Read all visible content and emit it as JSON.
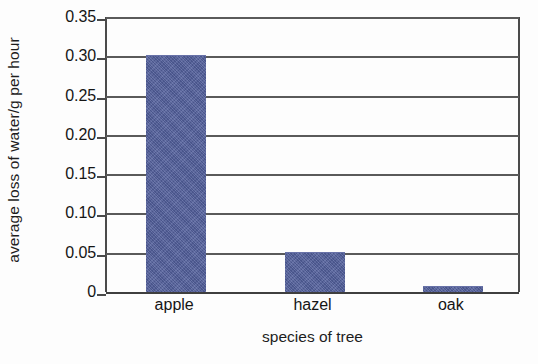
{
  "chart_data": {
    "type": "bar",
    "title": "",
    "xlabel": "species of tree",
    "ylabel": "average loss of water/g per hour",
    "categories": [
      "apple",
      "hazel",
      "oak"
    ],
    "values": [
      0.3,
      0.05,
      0.007
    ],
    "ylim": [
      0,
      0.35
    ],
    "ytick_labels": [
      "0",
      "0.05",
      "0.10",
      "0.15",
      "0.20",
      "0.25",
      "0.30",
      "0.35"
    ],
    "ytick_values": [
      0,
      0.05,
      0.1,
      0.15,
      0.2,
      0.25,
      0.3,
      0.35
    ],
    "grid": true,
    "legend": false,
    "bar_color": "#525f9c",
    "axis_color": "#4a4a4a",
    "background_color": "#fdfdfd"
  }
}
